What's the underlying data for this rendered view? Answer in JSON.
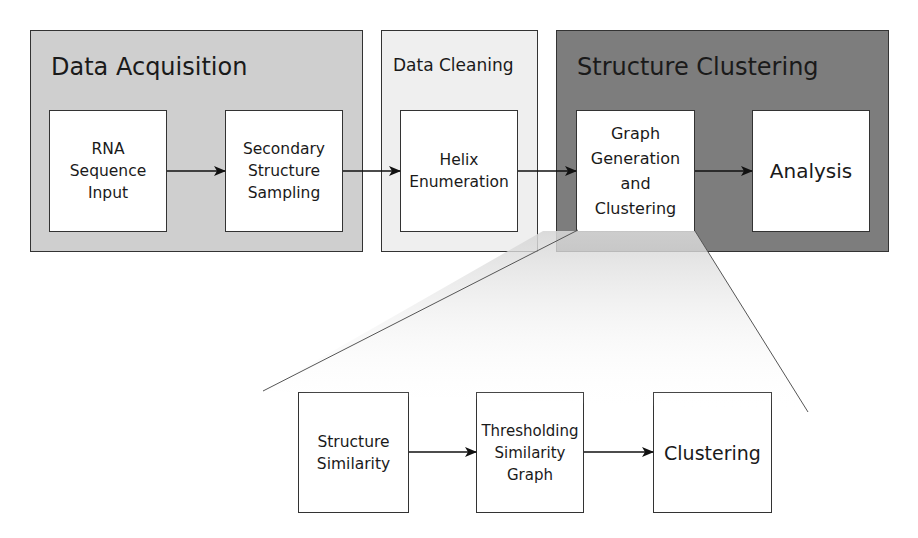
{
  "diagram": {
    "colors": {
      "acquisition_bg": "#cfcfcf",
      "cleaning_bg": "#efefef",
      "clustering_bg": "#7d7d7d",
      "box_bg": "#ffffff",
      "stroke": "#333333"
    },
    "stages": [
      {
        "title": "Data Acquisition",
        "steps": [
          "RNA\nSequence\nInput",
          "Secondary\nStructure\nSampling"
        ]
      },
      {
        "title": "Data Cleaning",
        "steps": [
          "Helix\nEnumeration"
        ]
      },
      {
        "title": "Structure Clustering",
        "steps": [
          "Graph\nGeneration\nand\nClustering",
          "Analysis"
        ]
      }
    ],
    "detail": {
      "expands": "Graph Generation and Clustering",
      "steps": [
        "Structure\nSimilarity",
        "Thresholding\nSimilarity\nGraph",
        "Clustering"
      ]
    }
  }
}
